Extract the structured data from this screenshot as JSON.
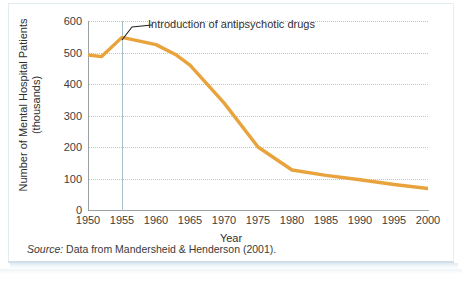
{
  "figure": {
    "annotation": "Introduction of antipsychotic drugs",
    "source_prefix": "Source:",
    "source_rest": " Data from Mandersheid & Henderson (2001).",
    "line_color": "#E8A33D",
    "axis_color": "#9AA1A4",
    "grid_color": "#BFC6C9",
    "marker_color": "#A8BFC9",
    "leader_color": "#222222"
  },
  "chart_data": {
    "type": "line",
    "title": "",
    "xlabel": "Year",
    "ylabel_line1": "Number of Mental Hospital Patients",
    "ylabel_line2": "(thousands)",
    "xlim": [
      1950,
      2000
    ],
    "ylim": [
      0,
      600
    ],
    "grid": true,
    "legend": "none",
    "xticks": [
      1950,
      1955,
      1960,
      1965,
      1970,
      1975,
      1980,
      1985,
      1990,
      1995,
      2000
    ],
    "xtick_labels": [
      "1950",
      "1955",
      "1960",
      "1965",
      "1970",
      "1975",
      "1980",
      "1985",
      "1990",
      "1995",
      "2000"
    ],
    "yticks": [
      0,
      100,
      200,
      300,
      400,
      500,
      600
    ],
    "ytick_labels": [
      "0",
      "100",
      "200",
      "300",
      "400",
      "500",
      "600"
    ],
    "series": [
      {
        "name": "Number of Mental Hospital Patients (thousands)",
        "color": "#E8A33D",
        "x": [
          1950,
          1952,
          1955,
          1960,
          1963,
          1965,
          1970,
          1975,
          1980,
          1985,
          1990,
          1995,
          2000
        ],
        "values": [
          492,
          487,
          548,
          525,
          492,
          460,
          340,
          200,
          127,
          110,
          96,
          81,
          68
        ]
      }
    ],
    "annotations": [
      {
        "text": "Introduction of antipsychotic drugs",
        "points_to_x": 1955,
        "points_to_y": 548
      }
    ],
    "reference_lines": [
      {
        "name": "year-1955-marker",
        "orientation": "vertical",
        "x": 1955
      }
    ]
  }
}
